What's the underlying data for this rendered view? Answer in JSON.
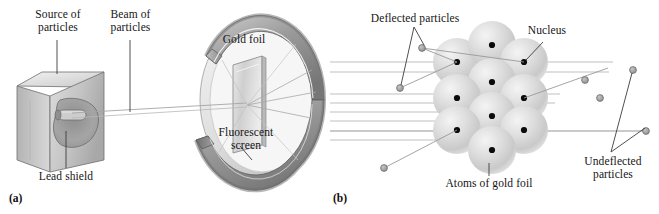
{
  "figure": {
    "background_color": "#ffffff",
    "width": 659,
    "height": 214
  },
  "panel_a": {
    "tag": "(a)",
    "labels": {
      "source_of_particles": "Source of\nparticles",
      "beam_of_particles": "Beam of\nparticles",
      "lead_shield": "Lead shield",
      "gold_foil": "Gold foil",
      "fluorescent_screen": "Fluorescent\nscreen"
    },
    "components": [
      {
        "name": "lead-shield-cube",
        "description": "grey 3D cube with interior cavity holding radioactive source"
      },
      {
        "name": "particle-beam",
        "description": "narrow beam from source cavity to gold foil"
      },
      {
        "name": "gold-foil-sheet",
        "description": "thin upright rectangular foil at center of detector ring"
      },
      {
        "name": "fluorescent-screen-ring",
        "description": "C-shaped circular detector screen open toward the source"
      },
      {
        "name": "scattered-rays",
        "description": "three rays fanning from foil to the screen"
      }
    ],
    "colors": {
      "metal_light": "#e3e3e3",
      "metal_mid": "#bdbdbd",
      "metal_dark": "#8f8f8f",
      "metal_shadow": "#6e6e6e",
      "ray": "#9a9a9a",
      "outline": "#4a4a4a"
    }
  },
  "panel_b": {
    "tag": "(b)",
    "labels": {
      "deflected_particles": "Deflected particles",
      "nucleus": "Nucleus",
      "atoms_of_gold_foil": "Atoms of gold foil",
      "undeflected_particles": "Undeflected\nparticles"
    },
    "atom_count": 10,
    "atom_rows": [
      {
        "row": 1,
        "atoms": 3
      },
      {
        "row": 2,
        "atoms": 2
      },
      {
        "row": 3,
        "atoms": 3
      },
      {
        "row": 4,
        "atoms": 2
      }
    ],
    "incoming_beam_lines": 8,
    "deflected_particle_markers": 5,
    "undeflected_particle_markers": 4,
    "colors": {
      "atom_fill": "#d6d6d6",
      "atom_highlight": "#f0f0f0",
      "nucleus": "#0b0b0b",
      "beam_line": "#b3b3b3",
      "particle_dot": "#9e9e9e",
      "leader_line": "#4f4f4f"
    }
  }
}
